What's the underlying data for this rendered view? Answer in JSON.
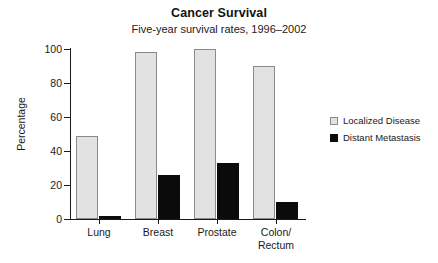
{
  "chart_data": {
    "type": "bar",
    "title": "Cancer Survival",
    "subtitle": "Five-year survival rates, 1996–2002",
    "xlabel": "",
    "ylabel": "Percentage",
    "ylim": [
      0,
      100
    ],
    "yticks": [
      0,
      20,
      40,
      60,
      80,
      100
    ],
    "ytick_labels": [
      "0",
      "20",
      "40",
      "60",
      "80",
      "100"
    ],
    "grid": false,
    "legend_position": "right",
    "categories": [
      "Lung",
      "Breast",
      "Prostate",
      "Colon/\nRectum"
    ],
    "series": [
      {
        "name": "Localized Disease",
        "color": "#e2e2e2",
        "edge_color": "#8a8a8a",
        "values": [
          49,
          98,
          100,
          90
        ]
      },
      {
        "name": "Distant Metastasis",
        "color": "#0b0b0b",
        "edge_color": "#0b0b0b",
        "values": [
          2,
          26,
          33,
          10
        ]
      }
    ]
  },
  "legend": {
    "items": [
      {
        "label": "Localized Disease",
        "swatch": "localized"
      },
      {
        "label": "Distant Metastasis",
        "swatch": "distant"
      }
    ]
  },
  "colors": {
    "localized_fill": "#e2e2e2",
    "localized_edge": "#8a8a8a",
    "distant_fill": "#0b0b0b",
    "axis": "#1a1a1a",
    "background": "#ffffff"
  }
}
